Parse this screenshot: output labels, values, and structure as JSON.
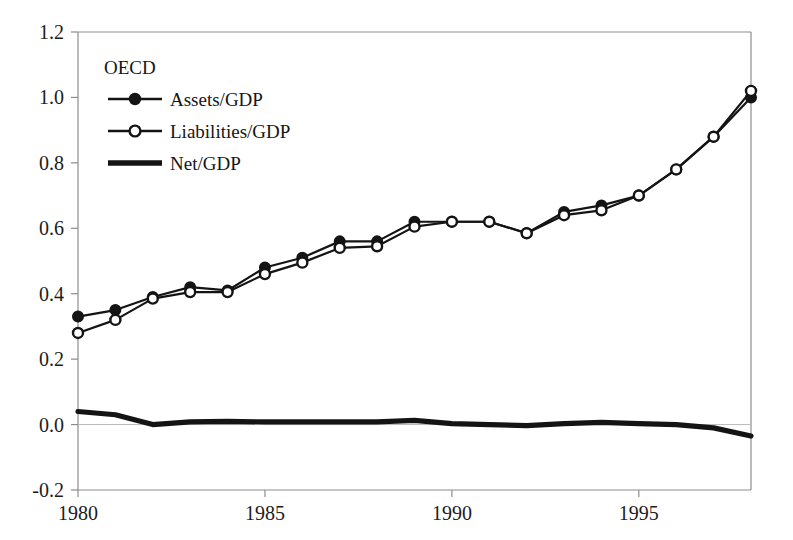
{
  "chart_data": {
    "type": "line",
    "title": "",
    "subtitle": "",
    "xlabel": "",
    "ylabel": "",
    "legend_title": "OECD",
    "legend_position": "upper-left-inside",
    "grid": false,
    "xlim": [
      1980,
      1998
    ],
    "ylim": [
      -0.2,
      1.2
    ],
    "yticks": [
      "1.2",
      "1.0",
      "0.8",
      "0.6",
      "0.4",
      "0.2",
      "0.0",
      "-0.2"
    ],
    "ytick_values": [
      1.2,
      1.0,
      0.8,
      0.6,
      0.4,
      0.2,
      0.0,
      -0.2
    ],
    "xticks": [
      "1980",
      "1985",
      "1990",
      "1995"
    ],
    "xtick_values": [
      1980,
      1985,
      1990,
      1995
    ],
    "x": [
      1980,
      1981,
      1982,
      1983,
      1984,
      1985,
      1986,
      1987,
      1988,
      1989,
      1990,
      1991,
      1992,
      1993,
      1994,
      1995,
      1996,
      1997,
      1998
    ],
    "series": [
      {
        "name": "Assets/GDP",
        "marker": "filled-circle",
        "color": "#141414",
        "values": [
          0.33,
          0.35,
          0.39,
          0.42,
          0.41,
          0.48,
          0.51,
          0.56,
          0.56,
          0.62,
          0.62,
          0.62,
          0.585,
          0.65,
          0.67,
          0.7,
          0.78,
          0.88,
          1.0
        ]
      },
      {
        "name": "Liabilities/GDP",
        "marker": "open-circle",
        "color": "#141414",
        "values": [
          0.28,
          0.32,
          0.385,
          0.405,
          0.405,
          0.46,
          0.495,
          0.54,
          0.545,
          0.605,
          0.62,
          0.62,
          0.585,
          0.64,
          0.655,
          0.7,
          0.78,
          0.88,
          1.02
        ]
      },
      {
        "name": "Net/GDP",
        "marker": "none",
        "color": "#141414",
        "values": [
          0.04,
          0.03,
          0.0,
          0.008,
          0.01,
          0.008,
          0.008,
          0.008,
          0.008,
          0.013,
          0.003,
          0.0,
          -0.003,
          0.003,
          0.007,
          0.003,
          0.0,
          -0.01,
          -0.035
        ]
      }
    ]
  },
  "legend": {
    "title": "OECD",
    "entries": [
      {
        "label": "Assets/GDP",
        "marker": "filled-circle-icon"
      },
      {
        "label": "Liabilities/GDP",
        "marker": "open-circle-icon"
      },
      {
        "label": "Net/GDP",
        "marker": "thick-line-icon"
      }
    ]
  },
  "colors": {
    "ink": "#141414",
    "axis": "#8d8d8d",
    "zero_rule": "#b9b9b9",
    "background": "#ffffff"
  }
}
